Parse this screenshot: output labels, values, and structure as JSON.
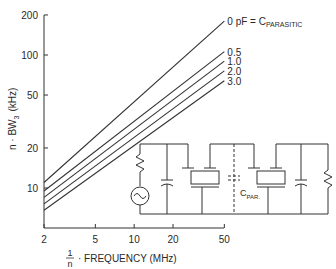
{
  "chart_data": {
    "type": "line",
    "title": "",
    "xlabel_fraction_num": "1",
    "xlabel_fraction_den": "n",
    "xlabel": "· FREQUENCY (MHz)",
    "ylabel_main": "n · BW",
    "ylabel_sub": "3",
    "ylabel_unit": "(kHz)",
    "xscale": "log",
    "yscale": "log",
    "xlim": [
      2,
      50
    ],
    "ylim": [
      6,
      200
    ],
    "x_ticks": [
      {
        "value": 2,
        "label": "2"
      },
      {
        "value": 5,
        "label": "5"
      },
      {
        "value": 10,
        "label": "10"
      },
      {
        "value": 20,
        "label": "20"
      },
      {
        "value": 50,
        "label": "50"
      }
    ],
    "y_ticks": [
      {
        "value": 10,
        "label": "10"
      },
      {
        "value": 20,
        "label": "20"
      },
      {
        "value": 50,
        "label": "50"
      },
      {
        "value": 100,
        "label": "100"
      },
      {
        "value": 200,
        "label": "200"
      }
    ],
    "grid": false,
    "legend_position": "inline-right-of-curves",
    "x": [
      2,
      50
    ],
    "series": [
      {
        "name": "0 pF = C_PARASITIC",
        "label": "0 pF = C",
        "label_sub": "PARASITIC",
        "values": [
          11.0,
          180
        ]
      },
      {
        "name": "0.5",
        "label": "0.5",
        "label_sub": "",
        "values": [
          9.5,
          106
        ]
      },
      {
        "name": "1.0",
        "label": "1.0",
        "label_sub": "",
        "values": [
          8.5,
          90
        ]
      },
      {
        "name": "2.0",
        "label": "2.0",
        "label_sub": "",
        "values": [
          7.6,
          76
        ]
      },
      {
        "name": "3.0",
        "label": "3.0",
        "label_sub": "",
        "values": [
          6.8,
          64
        ]
      }
    ],
    "inset": {
      "type": "circuit-schematic",
      "description": "Source with series resistor, shunt capacitor, two crystal resonators with parasitic capacitance between, shunt capacitor, load resistor",
      "label": "C",
      "label_sub": "PAR."
    }
  },
  "colors": {
    "ink": "#2a2a2a",
    "background": "#ffffff"
  }
}
